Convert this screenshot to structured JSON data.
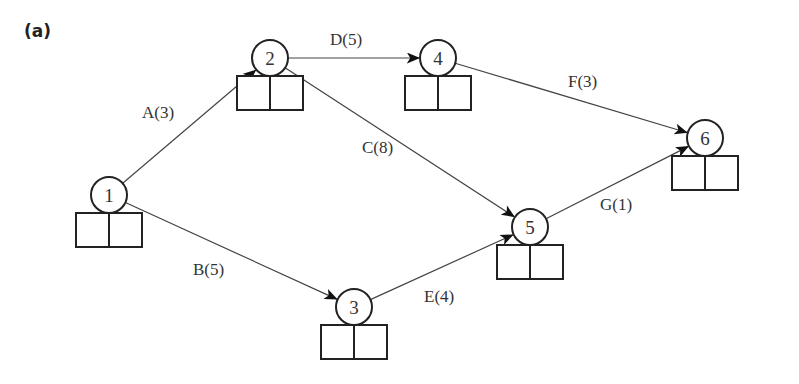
{
  "panel_label": "(a)",
  "colors": {
    "line": "#444444",
    "node_stroke": "#222222",
    "text": "#333333",
    "background": "#ffffff"
  },
  "diagram": {
    "type": "activity-on-arrow network",
    "nodes": [
      {
        "id": "1",
        "label": "1",
        "cx": 109,
        "cy": 195
      },
      {
        "id": "2",
        "label": "2",
        "cx": 270,
        "cy": 58
      },
      {
        "id": "3",
        "label": "3",
        "cx": 354,
        "cy": 307
      },
      {
        "id": "4",
        "label": "4",
        "cx": 438,
        "cy": 58
      },
      {
        "id": "5",
        "label": "5",
        "cx": 530,
        "cy": 227
      },
      {
        "id": "6",
        "label": "6",
        "cx": 705,
        "cy": 138
      }
    ],
    "edges": [
      {
        "from": "1",
        "to": "2",
        "activity": "A",
        "duration": 3,
        "label": "A(3)",
        "lx": 142,
        "ly": 118
      },
      {
        "from": "1",
        "to": "3",
        "activity": "B",
        "duration": 5,
        "label": "B(5)",
        "lx": 193,
        "ly": 275
      },
      {
        "from": "2",
        "to": "5",
        "activity": "C",
        "duration": 8,
        "label": "C(8)",
        "lx": 362,
        "ly": 153
      },
      {
        "from": "2",
        "to": "4",
        "activity": "D",
        "duration": 5,
        "label": "D(5)",
        "lx": 330,
        "ly": 45
      },
      {
        "from": "3",
        "to": "5",
        "activity": "E",
        "duration": 4,
        "label": "E(4)",
        "lx": 424,
        "ly": 302
      },
      {
        "from": "4",
        "to": "6",
        "activity": "F",
        "duration": 3,
        "label": "F(3)",
        "lx": 568,
        "ly": 87
      },
      {
        "from": "5",
        "to": "6",
        "activity": "G",
        "duration": 1,
        "label": "G(1)",
        "lx": 600,
        "ly": 210
      }
    ]
  }
}
